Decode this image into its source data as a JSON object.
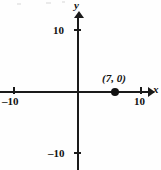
{
  "axes": {
    "x_name": "x",
    "y_name": "y"
  },
  "ticks": {
    "x_negative": "–10",
    "x_positive": "10",
    "y_positive": "10",
    "y_negative": "–10"
  },
  "point": {
    "label": "(7, 0)",
    "marker": "filled-dot"
  },
  "chart_data": {
    "type": "scatter",
    "title": "",
    "xlabel": "x",
    "ylabel": "y",
    "xlim": [
      -12,
      11
    ],
    "ylim": [
      -13,
      12
    ],
    "xticks": [
      -10,
      10
    ],
    "yticks": [
      -10,
      10
    ],
    "xticklabels": [
      "–10",
      "10"
    ],
    "yticklabels": [
      "–10",
      "10"
    ],
    "grid": false,
    "legend": null,
    "series": [
      {
        "name": "plotted point",
        "marker": "filled circle",
        "color": "#111111",
        "points": [
          {
            "x": 7,
            "y": 0,
            "label": "(7, 0)"
          }
        ]
      }
    ],
    "annotations": [
      {
        "text": "(7, 0)",
        "x": 7,
        "y": 0,
        "position": "above-left of marker"
      }
    ]
  }
}
